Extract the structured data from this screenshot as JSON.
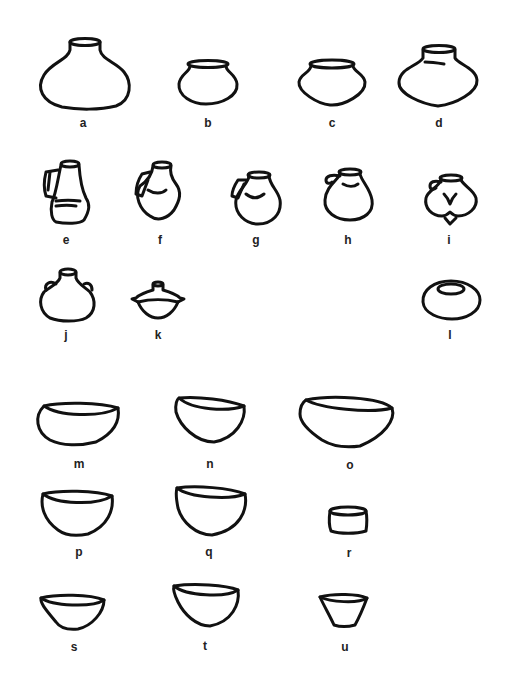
{
  "figure": {
    "type": "pottery-vessel-typology-plate",
    "background": "#ffffff",
    "ink_color": "#111111",
    "rows": [
      {
        "category": "globular pots / jars",
        "vessels": [
          "a",
          "b",
          "c",
          "d"
        ]
      },
      {
        "category": "handled jugs",
        "vessels": [
          "e",
          "f",
          "g",
          "h",
          "i"
        ]
      },
      {
        "category": "lugged jar, lidded vessel, hole-mouth jar",
        "vessels": [
          "j",
          "k",
          "l"
        ]
      },
      {
        "category": "bowls",
        "vessels": [
          "m",
          "n",
          "o"
        ]
      },
      {
        "category": "bowls and cup",
        "vessels": [
          "p",
          "q",
          "r"
        ]
      },
      {
        "category": "bowls and beaker",
        "vessels": [
          "s",
          "t",
          "u"
        ]
      }
    ],
    "vessels": {
      "a": {
        "label": "a",
        "shape": "large globular jar with short neck"
      },
      "b": {
        "label": "b",
        "shape": "small round pot with everted rim"
      },
      "c": {
        "label": "c",
        "shape": "carinated pot with everted rim"
      },
      "d": {
        "label": "d",
        "shape": "carinated jar with short neck"
      },
      "e": {
        "label": "e",
        "shape": "tall jug with handle, angular base"
      },
      "f": {
        "label": "f",
        "shape": "jug with handle, biconical body"
      },
      "g": {
        "label": "g",
        "shape": "round jug with handle"
      },
      "h": {
        "label": "h",
        "shape": "round jug with small loop handle"
      },
      "i": {
        "label": "i",
        "shape": "lobed jug with loop handle"
      },
      "j": {
        "label": "j",
        "shape": "globular flask with two lugs"
      },
      "k": {
        "label": "k",
        "shape": "lidded bowl with knob"
      },
      "l": {
        "label": "l",
        "shape": "hole-mouth jar"
      },
      "m": {
        "label": "m",
        "shape": "shallow wide bowl"
      },
      "n": {
        "label": "n",
        "shape": "deep rounded bowl"
      },
      "o": {
        "label": "o",
        "shape": "large wide conical bowl"
      },
      "p": {
        "label": "p",
        "shape": "hemispherical bowl"
      },
      "q": {
        "label": "q",
        "shape": "deep hemispherical bowl"
      },
      "r": {
        "label": "r",
        "shape": "small cylindrical cup"
      },
      "s": {
        "label": "s",
        "shape": "small conical bowl"
      },
      "t": {
        "label": "t",
        "shape": "deep rounded bowl"
      },
      "u": {
        "label": "u",
        "shape": "flared beaker with flat base"
      }
    }
  }
}
